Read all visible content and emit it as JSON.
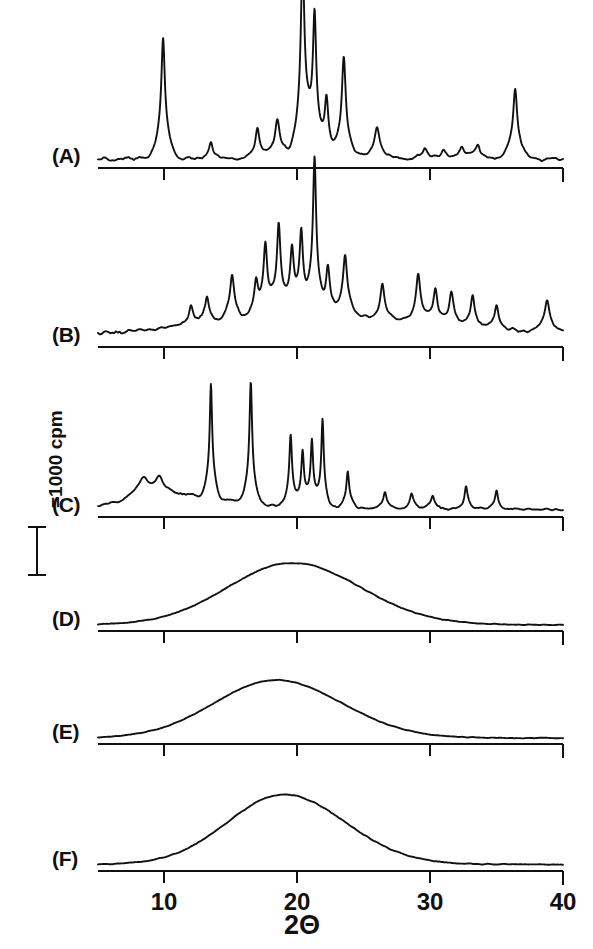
{
  "figure": {
    "line_color": "#111111",
    "axis_color": "#111111",
    "background_color": "#ffffff"
  },
  "axis": {
    "title": "2Θ",
    "tick_labels": [
      "10",
      "20",
      "30",
      "40"
    ],
    "tick_values": [
      10,
      20,
      30,
      40
    ],
    "xmin": 5,
    "xmax": 40
  },
  "scale_bar": {
    "caption": "=1000 cpm",
    "value": 1000,
    "units": "cpm"
  },
  "panels": [
    {
      "label": "(A)"
    },
    {
      "label": "(B)"
    },
    {
      "label": "(C)"
    },
    {
      "label": "(D)"
    },
    {
      "label": "(E)"
    },
    {
      "label": "(F)"
    }
  ],
  "chart_data": {
    "type": "line",
    "xlabel": "2Θ",
    "ylabel": "Intensity (cpm)",
    "xlim": [
      5,
      40
    ],
    "grid": false,
    "legend": "none",
    "tick_labels": [
      "10",
      "20",
      "30",
      "40"
    ],
    "scale_bar_cpm": 1000,
    "series": [
      {
        "name": "(A)",
        "description": "Highly crystalline pattern with sharp Bragg reflections",
        "baseline_noise": 0.02,
        "peaks": [
          {
            "position": 9.9,
            "height": 0.62,
            "width": 0.3
          },
          {
            "position": 13.5,
            "height": 0.09,
            "width": 0.32
          },
          {
            "position": 17.0,
            "height": 0.16,
            "width": 0.33
          },
          {
            "position": 18.5,
            "height": 0.2,
            "width": 0.38
          },
          {
            "position": 20.4,
            "height": 1.0,
            "width": 0.3
          },
          {
            "position": 21.3,
            "height": 0.7,
            "width": 0.28
          },
          {
            "position": 22.2,
            "height": 0.28,
            "width": 0.3
          },
          {
            "position": 23.5,
            "height": 0.52,
            "width": 0.32
          },
          {
            "position": 26.0,
            "height": 0.16,
            "width": 0.42
          },
          {
            "position": 29.6,
            "height": 0.05,
            "width": 0.4
          },
          {
            "position": 31.0,
            "height": 0.05,
            "width": 0.38
          },
          {
            "position": 32.4,
            "height": 0.06,
            "width": 0.36
          },
          {
            "position": 33.6,
            "height": 0.07,
            "width": 0.36
          },
          {
            "position": 36.4,
            "height": 0.36,
            "width": 0.34
          }
        ]
      },
      {
        "name": "(B)",
        "description": "Crystalline pattern, many medium reflections rising toward 21",
        "baseline_noise": 0.025,
        "peaks": [
          {
            "position": 12.0,
            "height": 0.13,
            "width": 0.32
          },
          {
            "position": 13.2,
            "height": 0.17,
            "width": 0.32
          },
          {
            "position": 15.1,
            "height": 0.3,
            "width": 0.34
          },
          {
            "position": 16.9,
            "height": 0.22,
            "width": 0.3
          },
          {
            "position": 17.6,
            "height": 0.45,
            "width": 0.3
          },
          {
            "position": 18.6,
            "height": 0.58,
            "width": 0.3
          },
          {
            "position": 19.6,
            "height": 0.4,
            "width": 0.3
          },
          {
            "position": 20.3,
            "height": 0.5,
            "width": 0.28
          },
          {
            "position": 21.3,
            "height": 1.0,
            "width": 0.26
          },
          {
            "position": 22.3,
            "height": 0.3,
            "width": 0.3
          },
          {
            "position": 23.6,
            "height": 0.4,
            "width": 0.34
          },
          {
            "position": 26.4,
            "height": 0.22,
            "width": 0.32
          },
          {
            "position": 29.1,
            "height": 0.3,
            "width": 0.34
          },
          {
            "position": 30.4,
            "height": 0.22,
            "width": 0.32
          },
          {
            "position": 31.6,
            "height": 0.21,
            "width": 0.32
          },
          {
            "position": 33.2,
            "height": 0.21,
            "width": 0.32
          },
          {
            "position": 35.0,
            "height": 0.16,
            "width": 0.32
          },
          {
            "position": 38.8,
            "height": 0.22,
            "width": 0.4
          }
        ]
      },
      {
        "name": "(C)",
        "description": "Crystalline pattern with two dominant sharp peaks near 13.5 and 16.5",
        "baseline_noise": 0.02,
        "peaks": [
          {
            "position": 8.4,
            "height": 0.16,
            "width": 0.7
          },
          {
            "position": 9.6,
            "height": 0.14,
            "width": 0.7
          },
          {
            "position": 13.5,
            "height": 0.92,
            "width": 0.2
          },
          {
            "position": 16.5,
            "height": 1.0,
            "width": 0.22
          },
          {
            "position": 19.5,
            "height": 0.58,
            "width": 0.22
          },
          {
            "position": 20.4,
            "height": 0.44,
            "width": 0.22
          },
          {
            "position": 21.1,
            "height": 0.52,
            "width": 0.2
          },
          {
            "position": 21.9,
            "height": 0.72,
            "width": 0.2
          },
          {
            "position": 23.8,
            "height": 0.3,
            "width": 0.24
          },
          {
            "position": 26.6,
            "height": 0.14,
            "width": 0.28
          },
          {
            "position": 28.6,
            "height": 0.12,
            "width": 0.28
          },
          {
            "position": 30.2,
            "height": 0.11,
            "width": 0.28
          },
          {
            "position": 32.7,
            "height": 0.18,
            "width": 0.24
          },
          {
            "position": 35.0,
            "height": 0.16,
            "width": 0.24
          }
        ]
      },
      {
        "name": "(D)",
        "description": "Amorphous broad halo centred near 19.6",
        "baseline_noise": 0.012,
        "halo": {
          "center": 19.6,
          "height": 1.0,
          "width": 5.6,
          "tail_left": 0.22,
          "tail_right": 0.3
        }
      },
      {
        "name": "(E)",
        "description": "Amorphous broad halo centred near 18.4",
        "baseline_noise": 0.012,
        "halo": {
          "center": 18.4,
          "height": 1.0,
          "width": 5.2,
          "tail_left": 0.26,
          "tail_right": 0.34
        }
      },
      {
        "name": "(F)",
        "description": "Amorphous broad halo centred near 19.0",
        "baseline_noise": 0.012,
        "halo": {
          "center": 19.0,
          "height": 1.0,
          "width": 5.0,
          "tail_left": 0.2,
          "tail_right": 0.3
        }
      }
    ]
  },
  "layout": {
    "plot_left_x": 98,
    "plot_right_x": 563,
    "panel_baselines": [
      168,
      347,
      517,
      631,
      744,
      871
    ],
    "panel_heights": [
      150,
      120,
      95,
      62,
      58,
      70
    ],
    "label_positions": [
      {
        "x": 52,
        "y": 145
      },
      {
        "x": 52,
        "y": 324
      },
      {
        "x": 52,
        "y": 494
      },
      {
        "x": 52,
        "y": 608
      },
      {
        "x": 52,
        "y": 721
      },
      {
        "x": 52,
        "y": 848
      }
    ],
    "tick_label_y": 890,
    "axis_title_y": 912,
    "scale_bar": {
      "x": 37,
      "y_top": 527,
      "y_bottom": 575,
      "caption_x": 44,
      "caption_y": 508
    }
  }
}
